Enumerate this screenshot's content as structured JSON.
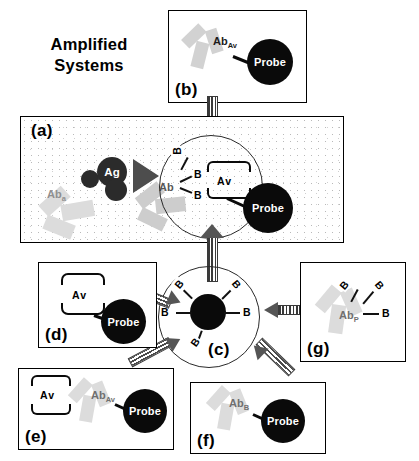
{
  "figure": {
    "title_line1": "Amplified",
    "title_line2": "Systems",
    "type": "immunoassay amplification scheme"
  },
  "panels": {
    "a": {
      "label": "(a)",
      "antibody_capture": "Ab",
      "antibody_capture_sub": "a",
      "antigen": "Ag",
      "antibody_detect": "Ab",
      "avidin": "Av",
      "probe": "Probe",
      "biotin_tags": [
        "B",
        "B",
        "B"
      ],
      "arrow_hint": "reaction-arrow"
    },
    "b": {
      "label": "(b)",
      "antibody": "Ab",
      "antibody_sub": "Av",
      "probe": "Probe"
    },
    "c": {
      "label": "(c)",
      "biotin_tags": [
        "B",
        "B",
        "B",
        "B",
        "B"
      ]
    },
    "d": {
      "label": "(d)",
      "avidin": "Av",
      "probe": "Probe"
    },
    "e": {
      "label": "(e)",
      "avidin": "Av",
      "antibody": "Ab",
      "antibody_sub": "Av",
      "probe": "Probe"
    },
    "f": {
      "label": "(f)",
      "antibody": "Ab",
      "antibody_sub": "B",
      "probe": "Probe"
    },
    "g": {
      "label": "(g)",
      "antibody": "Ab",
      "antibody_sub": "P",
      "biotin_tags": [
        "B",
        "B",
        "B"
      ]
    }
  },
  "colors": {
    "ink": "#000000",
    "probe_fill": "#0a0a0a",
    "antibody_grey": "#d2d2d2",
    "arrow_grey": "#4d4d4d"
  }
}
